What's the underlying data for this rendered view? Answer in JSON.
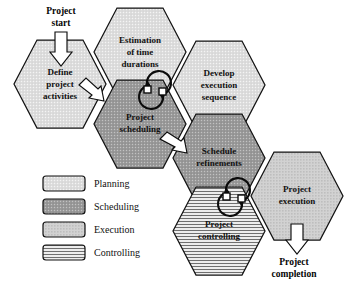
{
  "diagram": {
    "background_color": "#ffffff",
    "outline_color": "#131313"
  },
  "phases": {
    "planning": {
      "key": "planning",
      "label": "Planning",
      "fill": "#dcdcdc",
      "pattern": "fine-light-dots"
    },
    "scheduling": {
      "key": "scheduling",
      "label": "Scheduling",
      "fill": "#9a9a9a",
      "pattern": "medium-dots"
    },
    "execution": {
      "key": "execution",
      "label": "Execution",
      "fill": "#cfcfcf",
      "pattern": "coarse-dots"
    },
    "controlling": {
      "key": "controlling",
      "label": "Controlling",
      "fill": "#e2e2e2",
      "pattern": "horizontal-lines"
    }
  },
  "hexagons": [
    {
      "id": "define-project-activities",
      "lines": [
        "Define",
        "project",
        "activities"
      ],
      "phase": "planning",
      "cx": 60,
      "cy": 84,
      "r": 46
    },
    {
      "id": "estimation-of-time-durations",
      "lines": [
        "Estimation",
        "of time",
        "durations"
      ],
      "phase": "planning",
      "cx": 140,
      "cy": 52,
      "r": 46
    },
    {
      "id": "develop-execution-sequence",
      "lines": [
        "Develop",
        "execution",
        "sequence"
      ],
      "phase": "planning",
      "cx": 219,
      "cy": 85,
      "r": 46
    },
    {
      "id": "project-scheduling",
      "lines": [
        "Project",
        "scheduling"
      ],
      "phase": "scheduling",
      "cx": 140,
      "cy": 124,
      "r": 46
    },
    {
      "id": "schedule-refinements",
      "lines": [
        "Schedule",
        "refinements"
      ],
      "phase": "scheduling",
      "cx": 219,
      "cy": 158,
      "r": 46
    },
    {
      "id": "project-controlling",
      "lines": [
        "Project",
        "controlling"
      ],
      "phase": "controlling",
      "cx": 219,
      "cy": 231,
      "r": 46
    },
    {
      "id": "project-execution",
      "lines": [
        "Project",
        "execution"
      ],
      "phase": "execution",
      "cx": 297,
      "cy": 196,
      "r": 46
    }
  ],
  "flow_labels": [
    {
      "id": "project-start",
      "lines": [
        "Project",
        "start"
      ],
      "x": 61,
      "y": 17
    },
    {
      "id": "project-completion",
      "lines": [
        "Project",
        "completion"
      ],
      "x": 294,
      "y": 264
    }
  ],
  "block_arrows": [
    {
      "id": "arrow-project-start-down",
      "direction": "down"
    },
    {
      "id": "arrow-activities-to-estimation",
      "direction": "diagonal-up-right"
    },
    {
      "id": "arrow-scheduling-to-refinements",
      "direction": "diagonal-down-right"
    },
    {
      "id": "arrow-execution-to-completion",
      "direction": "down"
    }
  ],
  "cycle_arrows": [
    {
      "id": "cycle-estimation-scheduling",
      "between": [
        "estimation-of-time-durations",
        "project-scheduling"
      ]
    },
    {
      "id": "cycle-refinements-execution",
      "between": [
        "schedule-refinements",
        "project-execution"
      ]
    }
  ],
  "legend": {
    "items": [
      {
        "phase": "planning",
        "label": "Planning"
      },
      {
        "phase": "scheduling",
        "label": "Scheduling"
      },
      {
        "phase": "execution",
        "label": "Execution"
      },
      {
        "phase": "controlling",
        "label": "Controlling"
      }
    ]
  }
}
